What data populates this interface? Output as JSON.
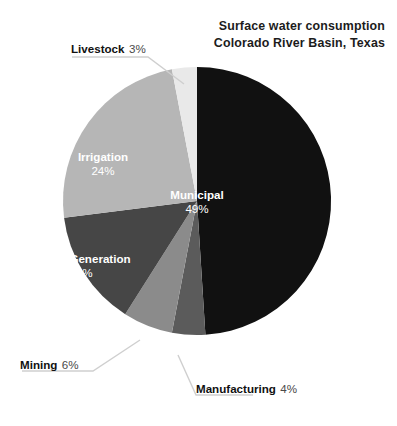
{
  "title": {
    "line1": "Surface  water consumption",
    "line2": "Colorado River Basin, Texas"
  },
  "chart_data": {
    "type": "pie",
    "title": "Surface water consumption Colorado River Basin, Texas",
    "xlabel": "",
    "ylabel": "",
    "units": "percent",
    "total": 100,
    "start_angle_deg": 0,
    "direction": "clockwise",
    "legend": "none",
    "grid": false,
    "categories": [
      "Municipal",
      "Manufacturing",
      "Mining",
      "Power Generation",
      "Irrigation",
      "Livestock"
    ],
    "values": [
      49,
      4,
      6,
      14,
      24,
      3
    ],
    "slices": [
      {
        "label": "Municipal",
        "value": 49,
        "value_text": "49%",
        "color": "#111111",
        "label_position": "inside",
        "label_color": "#ffffff"
      },
      {
        "label": "Manufacturing",
        "value": 4,
        "value_text": "4%",
        "color": "#5b5b5b",
        "label_position": "outside",
        "label_color": "#111111"
      },
      {
        "label": "Mining",
        "value": 6,
        "value_text": "6%",
        "color": "#8b8b8b",
        "label_position": "outside",
        "label_color": "#111111"
      },
      {
        "label": "Power Generation",
        "value": 14,
        "value_text": "14%",
        "color": "#464646",
        "label_position": "inside",
        "label_color": "#ffffff"
      },
      {
        "label": "Irrigation",
        "value": 24,
        "value_text": "24%",
        "color": "#b6b6b6",
        "label_position": "inside",
        "label_color": "#ffffff"
      },
      {
        "label": "Livestock",
        "value": 3,
        "value_text": "3%",
        "color": "#e9e9e9",
        "label_position": "outside",
        "label_color": "#111111"
      }
    ]
  },
  "colors": {
    "background": "#ffffff",
    "text": "#1a1a1a",
    "leader_line": "#cfcfcf",
    "municipal": "#111111",
    "manufacturing": "#5b5b5b",
    "mining": "#8b8b8b",
    "power_generation": "#464646",
    "irrigation": "#b6b6b6",
    "livestock": "#e9e9e9"
  }
}
